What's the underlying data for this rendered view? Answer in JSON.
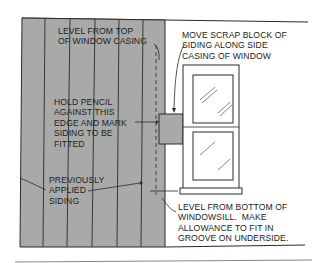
{
  "diagram": {
    "type": "siding-installation-illustration",
    "colors": {
      "siding_fill": "#a9a9a9",
      "line": "#2a2a2a",
      "background": "#ffffff",
      "window_fill": "#ffffff"
    },
    "labels": {
      "level_top": [
        "LEVEL FROM TOP",
        "OF WINDOW CASING"
      ],
      "move_scrap": [
        "MOVE SCRAP BLOCK OF",
        "SIDING ALONG SIDE",
        "CASING OF WINDOW"
      ],
      "hold_pencil": [
        "HOLD PENCIL",
        "AGAINST THIS",
        "EDGE AND MARK",
        "SIDING TO BE",
        "FITTED"
      ],
      "previously_applied": [
        "PREVIOUSLY",
        "APPLIED",
        "SIDING"
      ],
      "level_bottom": [
        "LEVEL FROM BOTTOM OF",
        "WINDOWSILL.  MAKE",
        "ALLOWANCE TO FIT IN",
        "GROOVE ON UNDERSIDE."
      ]
    },
    "elements": [
      "vertical-siding-boards",
      "scrap-block",
      "double-hung-window",
      "dashed-guide-line",
      "pencil-arrows"
    ]
  }
}
